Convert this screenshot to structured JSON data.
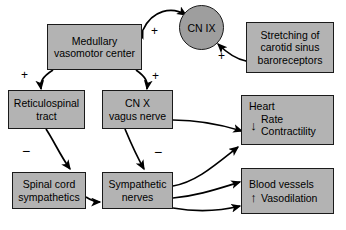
{
  "diagram": {
    "background_color": "#ffffff",
    "node_fill_color": "#b3b3b3",
    "circle_fill_color": "#9e9e9e",
    "stroke_color": "#1a1a1a",
    "nodes": {
      "medullary": {
        "label": "Medullary\nvasomotor center",
        "line1": "Medullary",
        "line2": "vasomotor center"
      },
      "cn_ix": {
        "label": "CN IX"
      },
      "baroreceptors": {
        "line1": "Stretching of",
        "line2": "carotid sinus",
        "line3": "baroreceptors"
      },
      "reticulospinal": {
        "line1": "Reticulospinal",
        "line2": "tract"
      },
      "cn_x": {
        "line1": "CN X",
        "line2": "vagus nerve"
      },
      "heart": {
        "title": "Heart",
        "arrow": "down",
        "arrow_glyph": "↓",
        "line1": "Rate",
        "line2": "Contractility"
      },
      "spinal_cord": {
        "line1": "Spinal cord",
        "line2": "sympathetics"
      },
      "sympathetic_nerves": {
        "line1": "Sympathetic",
        "line2": "nerves"
      },
      "blood_vessels": {
        "title": "Blood vessels",
        "arrow": "up",
        "arrow_glyph": "↑",
        "line1": "Vasodilation"
      }
    },
    "signs": {
      "cn_ix_to_medullary": "+",
      "baroreceptor_to_cn_ix": "+",
      "medullary_to_reticulospinal": "+",
      "medullary_to_cn_x": "+",
      "reticulospinal_to_spinal_cord": "−",
      "cn_x_to_sympathetic": "−"
    }
  }
}
